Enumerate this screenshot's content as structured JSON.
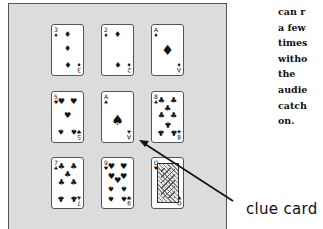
{
  "figure": {
    "cards": [
      {
        "id": "r1c1",
        "rank": "3",
        "suit": "♦",
        "pips": [
          {
            "x": 50,
            "y": 20,
            "s": "♦"
          },
          {
            "x": 50,
            "y": 48,
            "s": "♦"
          },
          {
            "x": 50,
            "y": 78,
            "s": "♦"
          }
        ]
      },
      {
        "id": "r1c2",
        "rank": "2",
        "suit": "♦",
        "pips": [
          {
            "x": 50,
            "y": 20,
            "s": "♦"
          },
          {
            "x": 50,
            "y": 78,
            "s": "♦"
          }
        ]
      },
      {
        "id": "r1c3",
        "rank": "A",
        "suit": "♦",
        "pips": [
          {
            "x": 50,
            "y": 50,
            "s": "♦",
            "big": true
          }
        ]
      },
      {
        "id": "r2c1",
        "rank": "5",
        "suit": "♥",
        "pips": [
          {
            "x": 30,
            "y": 20,
            "s": "♥"
          },
          {
            "x": 70,
            "y": 20,
            "s": "♥"
          },
          {
            "x": 50,
            "y": 48,
            "s": "♥"
          },
          {
            "x": 30,
            "y": 78,
            "s": "♠"
          },
          {
            "x": 70,
            "y": 78,
            "s": "♠"
          }
        ]
      },
      {
        "id": "r2c2",
        "rank": "A",
        "suit": "♣",
        "clue": true,
        "pips": [
          {
            "x": 50,
            "y": 55,
            "s": "♠",
            "big": true
          }
        ]
      },
      {
        "id": "r2c3",
        "rank": "8",
        "suit": "♣",
        "pips": [
          {
            "x": 30,
            "y": 18,
            "s": "♣"
          },
          {
            "x": 70,
            "y": 18,
            "s": "♣"
          },
          {
            "x": 50,
            "y": 33,
            "s": "♣"
          },
          {
            "x": 30,
            "y": 48,
            "s": "♣"
          },
          {
            "x": 70,
            "y": 48,
            "s": "♣"
          },
          {
            "x": 50,
            "y": 63,
            "s": "♣"
          },
          {
            "x": 30,
            "y": 80,
            "s": "♣"
          },
          {
            "x": 70,
            "y": 80,
            "s": "♣"
          }
        ]
      },
      {
        "id": "r3c1",
        "rank": "7",
        "suit": "♣",
        "pips": [
          {
            "x": 30,
            "y": 18,
            "s": "♣"
          },
          {
            "x": 70,
            "y": 18,
            "s": "♣"
          },
          {
            "x": 50,
            "y": 33,
            "s": "♣"
          },
          {
            "x": 30,
            "y": 50,
            "s": "♣"
          },
          {
            "x": 70,
            "y": 50,
            "s": "♣"
          },
          {
            "x": 30,
            "y": 80,
            "s": "♣"
          },
          {
            "x": 70,
            "y": 80,
            "s": "♣"
          }
        ]
      },
      {
        "id": "r3c2",
        "rank": "9",
        "suit": "♥",
        "pips": [
          {
            "x": 30,
            "y": 18,
            "s": "♥"
          },
          {
            "x": 70,
            "y": 18,
            "s": "♥"
          },
          {
            "x": 30,
            "y": 38,
            "s": "♥"
          },
          {
            "x": 70,
            "y": 38,
            "s": "♥"
          },
          {
            "x": 50,
            "y": 45,
            "s": "♥"
          },
          {
            "x": 30,
            "y": 60,
            "s": "♠"
          },
          {
            "x": 70,
            "y": 60,
            "s": "♠"
          },
          {
            "x": 30,
            "y": 80,
            "s": "♠"
          },
          {
            "x": 70,
            "y": 80,
            "s": "♠"
          }
        ]
      },
      {
        "id": "r3c3",
        "rank": "Q",
        "suit": "♥",
        "face": true,
        "pips": []
      }
    ],
    "annotation_label": "clue card"
  },
  "text_column": {
    "lines": [
      "can r",
      "a few",
      "times",
      "witho",
      "the",
      "audie",
      "catch",
      "on."
    ]
  }
}
